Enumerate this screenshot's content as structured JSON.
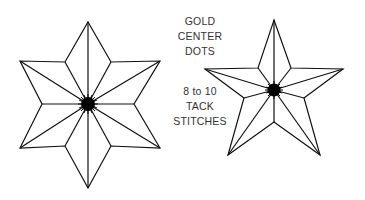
{
  "diagram": {
    "labels": {
      "line1": "GOLD",
      "line2": "CENTER",
      "line3": "DOTS",
      "line4": "8 to 10",
      "line5": "TACK",
      "line6": "STITCHES"
    },
    "shapes": [
      {
        "name": "six-point-star",
        "points": 6
      },
      {
        "name": "five-point-star",
        "points": 5
      }
    ],
    "colors": {
      "stroke": "#111111",
      "center": "#000000",
      "text": "#333333"
    }
  }
}
